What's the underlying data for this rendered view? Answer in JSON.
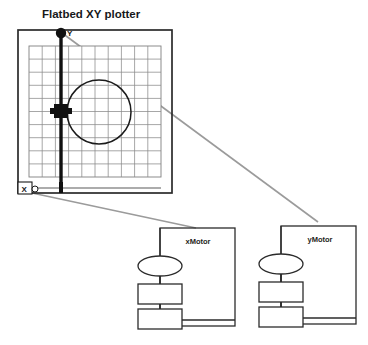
{
  "title": "Flatbed XY plotter",
  "plotter": {
    "y_axis_label": "Y",
    "x_axis_label": "X",
    "grid": {
      "columns": 10,
      "rows": 10
    },
    "drawn_shape": "circle",
    "pen_carriage": "pen-carriage-block",
    "y_rail": "vertical-rail",
    "x_rail": "horizontal-rail",
    "y_pulley": "y-pulley-circle"
  },
  "motors": [
    {
      "label": "xMotor",
      "parts": [
        "motor-ellipse",
        "gear-box-upper",
        "gear-box-lower"
      ]
    },
    {
      "label": "yMotor",
      "parts": [
        "motor-ellipse",
        "gear-box-upper",
        "gear-box-lower"
      ]
    }
  ],
  "connectors": [
    {
      "from": "x-axis-label",
      "to": "xMotor"
    },
    {
      "from": "y-pulley-circle",
      "to": "yMotor"
    }
  ],
  "colors": {
    "ink": "#17181a",
    "rail": "#111111",
    "grid_line": "#8a8a8a",
    "frame": "#2b2b2b",
    "connector": "#9b9b9b",
    "background": "#ffffff"
  }
}
